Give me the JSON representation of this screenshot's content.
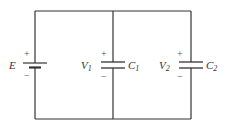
{
  "diagram": {
    "type": "circuit",
    "battery": {
      "label": "E",
      "plus": "+",
      "minus": "−"
    },
    "capacitor1": {
      "voltage_label": "V",
      "voltage_sub": "1",
      "cap_label": "C",
      "cap_sub": "1",
      "plus": "+",
      "minus": "−"
    },
    "capacitor2": {
      "voltage_label": "V",
      "voltage_sub": "2",
      "cap_label": "C",
      "cap_sub": "2",
      "plus": "+",
      "minus": "−"
    },
    "colors": {
      "wire": "#333333",
      "text": "#333333"
    }
  }
}
